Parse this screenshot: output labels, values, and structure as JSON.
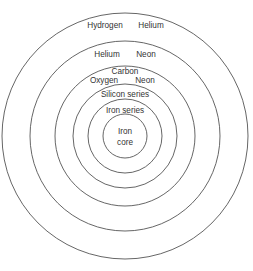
{
  "diagram": {
    "title": "",
    "type": "concentric onion-shell structure",
    "center": {
      "x": 125,
      "y": 136
    },
    "stroke_color": "#555555",
    "text_color": "#333333",
    "shells": [
      {
        "name": "shell-1",
        "radius": 123,
        "labels": [
          "Hydrogen",
          "Helium"
        ]
      },
      {
        "name": "shell-2",
        "radius": 95,
        "labels": [
          "Helium",
          "Neon"
        ]
      },
      {
        "name": "shell-3",
        "radius": 70,
        "labels": [
          "Carbon",
          "Oxygen",
          "Neon"
        ]
      },
      {
        "name": "shell-4",
        "radius": 52,
        "labels": [
          "Silicon series"
        ]
      },
      {
        "name": "shell-5",
        "radius": 37,
        "labels": [
          "Iron series"
        ]
      },
      {
        "name": "shell-6",
        "radius": 22,
        "labels": [
          "Iron",
          "core"
        ]
      }
    ],
    "labels": {
      "outer_left": "Hydrogen",
      "outer_right": "Helium",
      "second_left": "Helium",
      "second_right": "Neon",
      "third_top": "Carbon",
      "third_left": "Oxygen",
      "third_right": "Neon",
      "fourth": "Silicon series",
      "fifth": "Iron series",
      "core_line1": "Iron",
      "core_line2": "core"
    }
  }
}
